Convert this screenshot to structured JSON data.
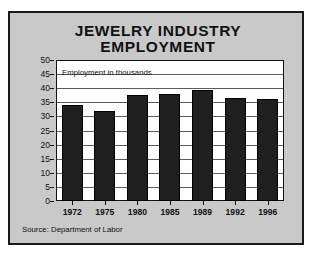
{
  "chart_data": {
    "type": "bar",
    "title": "JEWELRY INDUSTRY EMPLOYMENT",
    "title_line1": "JEWELRY INDUSTRY",
    "title_line2": "EMPLOYMENT",
    "annotation": "Employment in thousands",
    "source": "Source:  Department of Labor",
    "categories": [
      "1972",
      "1975",
      "1980",
      "1985",
      "1989",
      "1992",
      "1996"
    ],
    "values": [
      34,
      32,
      37.5,
      38,
      39.5,
      36.5,
      36
    ],
    "xlabel": "",
    "ylabel": "",
    "ylim": [
      0,
      50
    ],
    "ytick_labels": [
      "50",
      "45",
      "40",
      "35",
      "30",
      "25",
      "20",
      "15",
      "10",
      "5",
      "0"
    ],
    "ytick_values": [
      50,
      45,
      40,
      35,
      30,
      25,
      20,
      15,
      10,
      5,
      0
    ],
    "grid": true,
    "legend": "none",
    "bar_color": "#1f1f1f",
    "plot_background": "#ffffff",
    "figure_background": "#c9c9c9"
  }
}
